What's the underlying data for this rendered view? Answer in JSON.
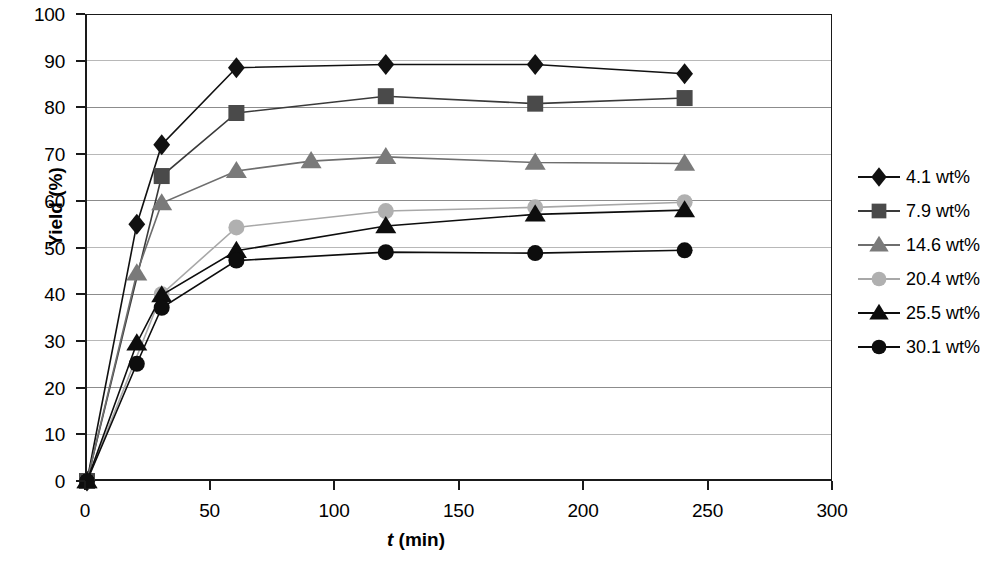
{
  "chart_data": {
    "type": "line",
    "title": "",
    "xlabel": "t (min)",
    "xlabel_italic_part": "t",
    "xlabel_rest": " (min)",
    "ylabel": "Yield (%)",
    "xlim": [
      0,
      300
    ],
    "ylim": [
      0,
      100
    ],
    "xticks": [
      0,
      50,
      100,
      150,
      200,
      250,
      300
    ],
    "yticks": [
      0,
      10,
      20,
      30,
      40,
      50,
      60,
      70,
      80,
      90,
      100
    ],
    "grid": "horizontal",
    "legend_position": "right",
    "series": [
      {
        "name": "4.1 wt%",
        "marker": "diamond",
        "color": "#111111",
        "line_color": "#111111",
        "x": [
          0,
          20,
          30,
          60,
          120,
          180,
          240
        ],
        "y": [
          0,
          55.0,
          72.0,
          88.5,
          89.2,
          89.2,
          87.2
        ]
      },
      {
        "name": "7.9 wt%",
        "marker": "square",
        "color": "#4a4a4a",
        "line_color": "#3a3a3a",
        "x": [
          0,
          30,
          60,
          120,
          180,
          240
        ],
        "y": [
          0,
          65.3,
          78.8,
          82.4,
          80.8,
          82.0
        ]
      },
      {
        "name": "14.6 wt%",
        "marker": "triangle",
        "color": "#7a7a7a",
        "line_color": "#6e6e6e",
        "x": [
          0,
          20,
          30,
          60,
          90,
          120,
          180,
          240
        ],
        "y": [
          0,
          44.5,
          59.5,
          66.4,
          68.5,
          69.4,
          68.2,
          68.0
        ]
      },
      {
        "name": "20.4 wt%",
        "marker": "circle",
        "color": "#b0b0b0",
        "line_color": "#a8a8a8",
        "x": [
          0,
          30,
          60,
          120,
          180,
          240
        ],
        "y": [
          0,
          40.0,
          54.3,
          57.8,
          58.6,
          59.7
        ]
      },
      {
        "name": "25.5 wt%",
        "marker": "triangle",
        "color": "#0d0d0d",
        "line_color": "#0d0d0d",
        "x": [
          0,
          20,
          30,
          60,
          120,
          180,
          240
        ],
        "y": [
          0,
          29.5,
          39.8,
          49.3,
          54.6,
          57.1,
          58.0
        ]
      },
      {
        "name": "30.1 wt%",
        "marker": "circle",
        "color": "#0d0d0d",
        "line_color": "#0d0d0d",
        "x": [
          0,
          20,
          30,
          60,
          120,
          180,
          240
        ],
        "y": [
          0,
          25.1,
          37.1,
          47.2,
          49.0,
          48.8,
          49.4
        ]
      }
    ]
  }
}
